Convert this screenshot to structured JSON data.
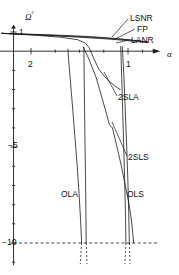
{
  "chart_data": {
    "type": "line",
    "title": "",
    "xlabel": "α",
    "ylabel": "Ω²",
    "xlim": [
      2.35,
      0.72
    ],
    "ylim": [
      -11.2,
      1.35
    ],
    "x_ticks_major": [
      2,
      1
    ],
    "x_tick_labels": [
      "2",
      "1"
    ],
    "y_ticks_major": [
      1,
      -5,
      -10
    ],
    "y_tick_labels": [
      "1",
      "−5",
      "−10"
    ],
    "grid": false,
    "legend_position": "inline-annotations",
    "annotations": [
      {
        "text": "LSNR",
        "x": 0.79,
        "y": 1.05
      },
      {
        "text": "FP",
        "x": 0.79,
        "y": 0.72
      },
      {
        "text": "LANR",
        "x": 0.79,
        "y": 0.4
      },
      {
        "text": "2SLA",
        "x": 1.02,
        "y": -2.05
      },
      {
        "text": "2SLS",
        "x": 0.93,
        "y": -5.15
      },
      {
        "text": "OLA",
        "x": 1.47,
        "y": -7.75
      },
      {
        "text": "OLS",
        "x": 0.92,
        "y": -7.75
      }
    ],
    "series": [
      {
        "name": "LSNR",
        "points": [
          [
            2.3,
            0.93
          ],
          [
            2.1,
            0.9
          ],
          [
            1.85,
            0.86
          ],
          [
            1.6,
            0.81
          ],
          [
            1.4,
            0.76
          ],
          [
            1.22,
            0.7
          ],
          [
            1.08,
            0.64
          ],
          [
            1.0,
            0.6
          ],
          [
            0.93,
            0.56
          ],
          [
            0.86,
            0.52
          ],
          [
            0.8,
            0.49
          ]
        ]
      },
      {
        "name": "FP",
        "points": [
          [
            2.3,
            0.93
          ],
          [
            2.05,
            0.88
          ],
          [
            1.8,
            0.83
          ],
          [
            1.55,
            0.77
          ],
          [
            1.32,
            0.71
          ],
          [
            1.15,
            0.65
          ],
          [
            1.02,
            0.6
          ],
          [
            0.93,
            0.55
          ],
          [
            0.86,
            0.51
          ],
          [
            0.8,
            0.48
          ]
        ]
      },
      {
        "name": "LANR",
        "points": [
          [
            2.3,
            0.93
          ],
          [
            2.0,
            0.86
          ],
          [
            1.72,
            0.79
          ],
          [
            1.48,
            0.72
          ],
          [
            1.28,
            0.66
          ],
          [
            1.12,
            0.6
          ],
          [
            1.0,
            0.55
          ],
          [
            0.9,
            0.5
          ],
          [
            0.83,
            0.46
          ],
          [
            0.8,
            0.44
          ]
        ]
      },
      {
        "name": "2SLA",
        "points": [
          [
            2.3,
            0.93
          ],
          [
            1.95,
            0.83
          ],
          [
            1.7,
            0.73
          ],
          [
            1.52,
            0.6
          ],
          [
            1.44,
            0.42
          ],
          [
            1.4,
            0.18
          ],
          [
            1.36,
            -0.3
          ],
          [
            1.3,
            -0.95
          ],
          [
            1.22,
            -1.45
          ],
          [
            1.14,
            -1.8
          ],
          [
            1.08,
            -2.0
          ]
        ]
      },
      {
        "name": "2SLA-branch",
        "points": [
          [
            1.46,
            0.22
          ],
          [
            1.4,
            -0.45
          ],
          [
            1.33,
            -1.35
          ],
          [
            1.27,
            -2.4
          ],
          [
            1.22,
            -3.3
          ],
          [
            1.19,
            -3.85
          ],
          [
            1.16,
            -4.0
          ]
        ]
      },
      {
        "name": "2SLS",
        "points": [
          [
            1.16,
            -4.0
          ],
          [
            1.12,
            -4.85
          ],
          [
            1.07,
            -5.95
          ],
          [
            1.03,
            -6.95
          ],
          [
            0.99,
            -7.95
          ],
          [
            0.965,
            -8.8
          ],
          [
            0.95,
            -9.55
          ],
          [
            0.942,
            -10.0
          ]
        ]
      },
      {
        "name": "OLA",
        "points": [
          [
            1.62,
            0.1
          ],
          [
            1.6,
            -1.2
          ],
          [
            1.575,
            -2.7
          ],
          [
            1.55,
            -4.3
          ],
          [
            1.525,
            -5.9
          ],
          [
            1.505,
            -7.4
          ],
          [
            1.49,
            -8.7
          ],
          [
            1.478,
            -10.0
          ]
        ]
      },
      {
        "name": "OLA-right",
        "points": [
          [
            1.455,
            0.2
          ],
          [
            1.452,
            -1.3
          ],
          [
            1.448,
            -3.0
          ],
          [
            1.443,
            -4.8
          ],
          [
            1.438,
            -6.5
          ],
          [
            1.434,
            -8.2
          ],
          [
            1.431,
            -10.0
          ]
        ]
      },
      {
        "name": "OLS",
        "points": [
          [
            1.075,
            0.25
          ],
          [
            1.065,
            -1.3
          ],
          [
            1.055,
            -3.05
          ],
          [
            1.045,
            -4.85
          ],
          [
            1.035,
            -6.6
          ],
          [
            1.027,
            -8.3
          ],
          [
            1.021,
            -10.0
          ]
        ]
      },
      {
        "name": "OLS-right",
        "points": [
          [
            1.058,
            0.22
          ],
          [
            1.042,
            -1.35
          ],
          [
            1.028,
            -3.1
          ],
          [
            1.014,
            -4.9
          ],
          [
            1.002,
            -6.65
          ],
          [
            0.993,
            -8.35
          ],
          [
            0.986,
            -10.0
          ]
        ]
      }
    ],
    "dashed_stubs": [
      {
        "x_top": 1.478,
        "x_bot": 1.492,
        "y_top": -10.0,
        "y_bot": -11.1
      },
      {
        "x_top": 1.431,
        "x_bot": 1.423,
        "y_top": -10.0,
        "y_bot": -11.1
      },
      {
        "x_top": 1.021,
        "x_bot": 1.032,
        "y_top": -10.0,
        "y_bot": -11.1
      },
      {
        "x_top": 0.986,
        "x_bot": 0.978,
        "y_top": -10.0,
        "y_bot": -11.1
      }
    ],
    "colors": {
      "line": "#1a1a1a",
      "axis": "#1a1a1a",
      "dash": "#1a1a1a",
      "background": "#ffffff"
    }
  }
}
